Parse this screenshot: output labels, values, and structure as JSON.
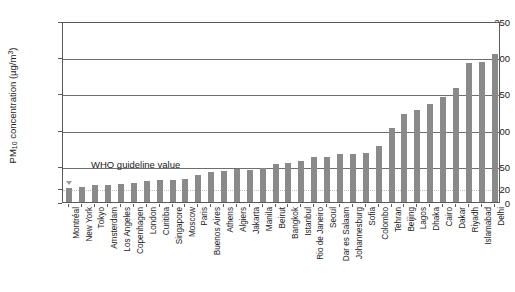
{
  "chart_data": {
    "type": "bar",
    "title": "",
    "subtitle": "",
    "xlabel": "",
    "ylabel": "PM10 concentration (µg/m3)",
    "ylabel_parts": {
      "prefix": "PM",
      "sub": "10",
      "mid": " concentration (µg/m",
      "sup": "3",
      "suffix": ")"
    },
    "ylim": [
      0,
      250
    ],
    "ytick_values": [
      0,
      20,
      50,
      100,
      150,
      200,
      250
    ],
    "ytick_labels": [
      "0",
      "20",
      "50",
      "100",
      "150",
      "200",
      "250"
    ],
    "gridlines_at": [
      20,
      50,
      100,
      150,
      200
    ],
    "grid": true,
    "legend": "none",
    "bar_color": "#8a8a8a",
    "axis_color": "#5a5a5a",
    "annotations": [
      {
        "text": "WHO guideline value",
        "value": 20,
        "marker": "down-arrow"
      }
    ],
    "categories": [
      "Montréal",
      "New York",
      "Tokyo",
      "Amsterdam",
      "Los Angeles",
      "Copenhagen",
      "London",
      "Curitiba",
      "Singapore",
      "Moscow",
      "Paris",
      "Buenos Aires",
      "Athens",
      "Algiers",
      "Jakarta",
      "Manila",
      "Beirut",
      "Bangkok",
      "Istanbul",
      "Rio de Janeiro",
      "Seoul",
      "Dar es Salaam",
      "Johannesburg",
      "Sofia",
      "Colombo",
      "Tehran",
      "Beijing",
      "Lagos",
      "Dhaka",
      "Cairo",
      "Dakar",
      "Riyadh",
      "Islamabad",
      "Delhi"
    ],
    "values": [
      19,
      21,
      23,
      24,
      25,
      26,
      29,
      30,
      31,
      32,
      38,
      41,
      43,
      45,
      44,
      47,
      52,
      54,
      56,
      62,
      62,
      66,
      67,
      68,
      77,
      102,
      122,
      127,
      135,
      145,
      158,
      192,
      194,
      205
    ]
  }
}
